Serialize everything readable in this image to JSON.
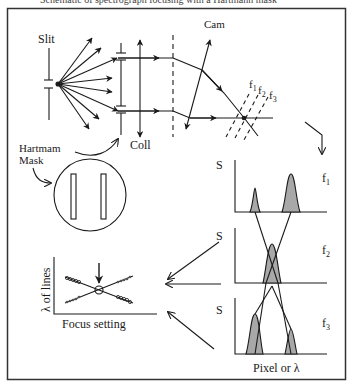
{
  "figure": {
    "cutoff_caption": "Schematic of spectrograph focusing with a Hartmann mask",
    "labels": {
      "slit": "Slit",
      "cam": "Cam",
      "coll": "Coll",
      "hartmann_line1": "Hartmam",
      "hartmann_line2": "Mask",
      "f1": "f",
      "f1_sub": "1",
      "f2": "f",
      "f2_sub": "2",
      "f3": "f",
      "f3_sub": "3",
      "signal_axis": "S",
      "x_axis": "Pixel or λ",
      "focus_ylabel": "λ of lines",
      "focus_xlabel": "Focus setting"
    },
    "panels": [
      {
        "name": "f1",
        "peaks": [
          {
            "pos": "left",
            "height": "small"
          },
          {
            "pos": "right",
            "height": "large"
          }
        ]
      },
      {
        "name": "f2",
        "peaks": [
          {
            "pos": "center",
            "height": "merged"
          }
        ]
      },
      {
        "name": "f3",
        "peaks": [
          {
            "pos": "left",
            "height": "large"
          },
          {
            "pos": "right",
            "height": "small"
          }
        ]
      }
    ],
    "colors": {
      "line": "#1a1a1a",
      "peak_fill": "#a8a8a8",
      "frame": "#333333"
    }
  }
}
